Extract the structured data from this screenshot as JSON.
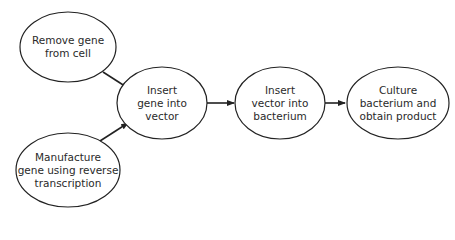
{
  "diagram": {
    "type": "flowchart",
    "colors": {
      "stroke": "#222222",
      "text": "#2a2a2a",
      "background": "#ffffff"
    },
    "nodes": [
      {
        "id": "remove",
        "lines": [
          "Remove gene",
          "from cell"
        ],
        "cx": 68,
        "cy": 47,
        "rx": 48,
        "ry": 35
      },
      {
        "id": "manufacture",
        "lines": [
          "Manufacture",
          "gene using reverse",
          "transcription"
        ],
        "cx": 68,
        "cy": 170,
        "rx": 52,
        "ry": 37
      },
      {
        "id": "insert_gene",
        "lines": [
          "Insert",
          "gene into",
          "vector"
        ],
        "cx": 162,
        "cy": 103,
        "rx": 45,
        "ry": 36
      },
      {
        "id": "insert_vector",
        "lines": [
          "Insert",
          "vector into",
          "bacterium"
        ],
        "cx": 280,
        "cy": 103,
        "rx": 45,
        "ry": 36
      },
      {
        "id": "culture",
        "lines": [
          "Culture",
          "bacterium and",
          "obtain product"
        ],
        "cx": 398,
        "cy": 103,
        "rx": 51,
        "ry": 36
      }
    ],
    "edges": [
      {
        "from": "remove",
        "to": "insert_gene"
      },
      {
        "from": "manufacture",
        "to": "insert_gene"
      },
      {
        "from": "insert_gene",
        "to": "insert_vector"
      },
      {
        "from": "insert_vector",
        "to": "culture"
      }
    ]
  }
}
